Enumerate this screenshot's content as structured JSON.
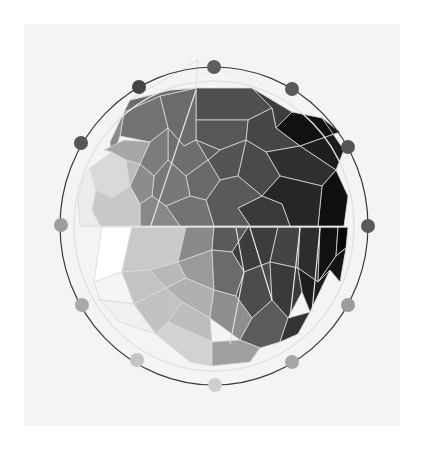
{
  "artwork": {
    "subject": "color-wheel-painting",
    "paper": {
      "x": 24,
      "y": 24,
      "width": 376,
      "height": 402,
      "color": "#f4f4f3"
    },
    "center": {
      "x": 214,
      "y": 226
    },
    "outer_ring": {
      "rx": 154,
      "ry": 159,
      "color": "#3a3a3a"
    },
    "inner_ring": {
      "rx": 140,
      "ry": 145,
      "color": "#e2e2e2"
    },
    "split_line_y": 227,
    "dots": [
      {
        "name": "dot-00",
        "x": 214,
        "y": 67,
        "color": "#5e5e5e"
      },
      {
        "name": "dot-01",
        "x": 292,
        "y": 89,
        "color": "#5a5a5a"
      },
      {
        "name": "dot-02",
        "x": 348,
        "y": 147,
        "color": "#565656"
      },
      {
        "name": "dot-03",
        "x": 368,
        "y": 226,
        "color": "#5b5b5b"
      },
      {
        "name": "dot-04",
        "x": 348,
        "y": 305,
        "color": "#9c9c9c"
      },
      {
        "name": "dot-05",
        "x": 292,
        "y": 362,
        "color": "#a6a6a6"
      },
      {
        "name": "dot-06",
        "x": 215,
        "y": 385,
        "color": "#cfcfcf"
      },
      {
        "name": "dot-07",
        "x": 137,
        "y": 360,
        "color": "#c4c4c4"
      },
      {
        "name": "dot-08",
        "x": 82,
        "y": 305,
        "color": "#a9a9a9"
      },
      {
        "name": "dot-09",
        "x": 61,
        "y": 225,
        "color": "#9d9d9d"
      },
      {
        "name": "dot-10",
        "x": 81,
        "y": 143,
        "color": "#555555"
      },
      {
        "name": "dot-11",
        "x": 139,
        "y": 87,
        "color": "#444444"
      }
    ],
    "cells": [
      {
        "p": "196,88 252,88 272,108 248,120 196,120",
        "c": "#4f4f4f"
      },
      {
        "p": "252,88 292,112 276,128 272,108",
        "c": "#3e3e3e"
      },
      {
        "p": "292,112 322,118 340,132 300,146 276,128",
        "c": "#111111"
      },
      {
        "p": "322,118 344,150 336,170 300,146 340,132",
        "c": "#1d1d1d"
      },
      {
        "p": "248,120 272,108 276,128 300,146 266,152 246,140",
        "c": "#464646"
      },
      {
        "p": "196,120 248,120 246,140 220,150 196,140",
        "c": "#575757"
      },
      {
        "p": "300,146 336,170 322,186 280,176 266,152",
        "c": "#303030"
      },
      {
        "p": "336,170 348,196 344,226 318,226 322,186",
        "c": "#0f0f0f"
      },
      {
        "p": "266,152 280,176 262,196 238,176 246,140",
        "c": "#4a4a4a"
      },
      {
        "p": "220,150 246,140 238,176 220,180 208,160",
        "c": "#545454"
      },
      {
        "p": "280,176 322,186 318,226 290,226 282,204 262,196",
        "c": "#262626"
      },
      {
        "p": "262,196 282,204 290,226 250,226 238,208",
        "c": "#3a3a3a"
      },
      {
        "p": "220,180 238,176 262,196 238,208 250,226 214,226 206,200",
        "c": "#5a5a5a"
      },
      {
        "p": "160,96 196,88 196,140 184,146 168,128",
        "c": "#6b6b6b"
      },
      {
        "p": "124,112 160,96 168,128 150,142 120,136",
        "c": "#737373"
      },
      {
        "p": "110,142 124,112 120,136 112,160",
        "c": "#8a8a8a"
      },
      {
        "p": "168,128 184,146 196,140 208,160 186,176 168,160",
        "c": "#6f6f6f"
      },
      {
        "p": "150,142 168,128 168,160 154,176 140,164",
        "c": "#7c7c7c"
      },
      {
        "p": "186,176 208,160 220,180 206,200 190,196",
        "c": "#6a6a6a"
      },
      {
        "p": "154,176 168,160 186,176 190,196 166,206 152,196",
        "c": "#787878"
      },
      {
        "p": "190,196 206,200 214,226 180,226 166,206",
        "c": "#737373"
      },
      {
        "p": "140,164 154,176 152,196 140,204 130,186",
        "c": "#8c8c8c"
      },
      {
        "p": "152,196 166,206 180,226 140,226 140,204",
        "c": "#888888"
      },
      {
        "p": "130,100 170,90 196,88 160,96 124,112",
        "c": "#6c6c6c"
      },
      {
        "p": "198,60 196,88 170,90 130,100",
        "c": "#f4f4f3"
      },
      {
        "p": "90,168 112,152 126,160 130,186 112,198 96,190",
        "c": "#d9d9d9"
      },
      {
        "p": "126,160 140,164 130,186",
        "c": "#bcbcbc"
      },
      {
        "p": "96,190 112,198 130,186 140,204 140,226 100,226 92,210",
        "c": "#c8c8c8"
      },
      {
        "p": "104,150 124,140 150,142 140,164 126,160 112,152",
        "c": "#a7a7a7"
      },
      {
        "p": "84,176 90,168 96,190 92,210 100,226 80,226 78,200",
        "c": "#ececec"
      },
      {
        "p": "102,227 132,227 122,272 94,282",
        "c": "#ffffff"
      },
      {
        "p": "132,227 186,227 178,262 150,270 122,272",
        "c": "#c9c9c9"
      },
      {
        "p": "186,227 214,227 212,250 178,262",
        "c": "#8a8a8a"
      },
      {
        "p": "214,227 248,227 232,252 212,250",
        "c": "#5a5a5a"
      },
      {
        "p": "248,227 278,227 270,262 244,272 232,252",
        "c": "#3d3d3d"
      },
      {
        "p": "278,227 300,227 298,268 270,262",
        "c": "#444444"
      },
      {
        "p": "300,227 320,227 318,282 298,268",
        "c": "#2d2d2d"
      },
      {
        "p": "320,227 338,227 336,256 318,282",
        "c": "#111111"
      },
      {
        "p": "338,227 348,227 346,248 336,256",
        "c": "#080808"
      },
      {
        "p": "94,282 122,272 134,304 100,300",
        "c": "#f5f5f5"
      },
      {
        "p": "122,272 150,270 166,288 134,304",
        "c": "#c3c3c3"
      },
      {
        "p": "150,270 178,262 186,278 166,288",
        "c": "#b8b8b8"
      },
      {
        "p": "178,262 212,250 214,290 186,278",
        "c": "#9a9a9a"
      },
      {
        "p": "212,250 232,252 244,272 236,296 214,290",
        "c": "#6b6b6b"
      },
      {
        "p": "244,272 270,262 272,300 252,318 236,296",
        "c": "#4c4c4c"
      },
      {
        "p": "270,262 298,268 302,292 288,318 272,300",
        "c": "#3a3a3a"
      },
      {
        "p": "298,268 318,282 330,270 310,312 302,292",
        "c": "#1e1e1e"
      },
      {
        "p": "318,282 336,256 346,248 340,282 330,270",
        "c": "#141414"
      },
      {
        "p": "100,300 134,304 156,334 120,322",
        "c": "#f0f0f0"
      },
      {
        "p": "134,304 166,288 182,302 168,322 156,334",
        "c": "#c2c2c2"
      },
      {
        "p": "166,288 186,278 214,290 210,318 182,302",
        "c": "#b0b0b0"
      },
      {
        "p": "182,302 210,318 212,342 168,322",
        "c": "#bdbdbd"
      },
      {
        "p": "214,290 236,296 252,318 240,340 210,318",
        "c": "#8e8e8e"
      },
      {
        "p": "252,318 272,300 288,318 280,342 260,348 240,340",
        "c": "#5b5b5b"
      },
      {
        "p": "288,318 310,312 298,334 280,342",
        "c": "#333333"
      },
      {
        "p": "156,334 168,322 212,342 212,366 190,362",
        "c": "#d2d2d2"
      },
      {
        "p": "212,342 240,340 260,348 250,362 212,366",
        "c": "#9f9f9f"
      },
      {
        "p": "196,140 220,150 208,160",
        "c": "#5d5d5d"
      }
    ],
    "overlay_curves": [
      {
        "d": "M 168 88 L 214 70 L 268 84",
        "stroke": "#eeeeee"
      },
      {
        "d": "M 196 90 L 150 228",
        "stroke": "#e6e6e6"
      },
      {
        "d": "M 250 228 L 272 300",
        "stroke": "#e6e6e6"
      },
      {
        "d": "M 300 228 L 290 318",
        "stroke": "#e6e6e6"
      },
      {
        "d": "M 320 228 L 312 312",
        "stroke": "#e6e6e6"
      },
      {
        "d": "M 236 228 L 244 272 L 230 344",
        "stroke": "#e0e0e0"
      }
    ]
  }
}
